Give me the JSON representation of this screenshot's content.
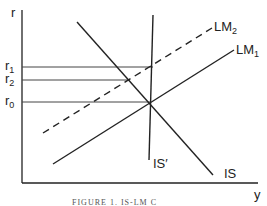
{
  "diagram": {
    "type": "IS-LM diagram",
    "axes": {
      "y_label": "r",
      "x_label": "y"
    },
    "levels": [
      {
        "base": "r",
        "sub": "1"
      },
      {
        "base": "r",
        "sub": "2"
      },
      {
        "base": "r",
        "sub": "0"
      }
    ],
    "curves": {
      "lm2": {
        "base": "LM",
        "sub": "2",
        "style": "dashed"
      },
      "lm1": {
        "base": "LM",
        "sub": "1",
        "style": "solid"
      },
      "is": {
        "label": "IS",
        "style": "solid"
      },
      "is_prime": {
        "label": "IS′",
        "style": "solid"
      }
    },
    "caption": "FIGURE 1. IS-LM C"
  },
  "colors": {
    "ink": "#222222",
    "guide": "#555555",
    "background": "#ffffff"
  }
}
